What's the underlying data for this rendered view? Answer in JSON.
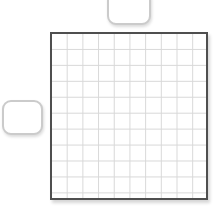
{
  "canvas": {
    "background": "#ffffff"
  },
  "grid": {
    "columns": 10,
    "rows": 11,
    "fill": "#ffffff",
    "border_color": "#4f4f4f",
    "line_color": "#d8d8d8"
  },
  "tiles": {
    "top": {
      "fill": "#ffffff",
      "border_color": "#cbcbcb",
      "state": "partially-offscreen-top"
    },
    "left": {
      "fill": "#ffffff",
      "border_color": "#cbcbcb",
      "state": "fully-visible"
    }
  }
}
